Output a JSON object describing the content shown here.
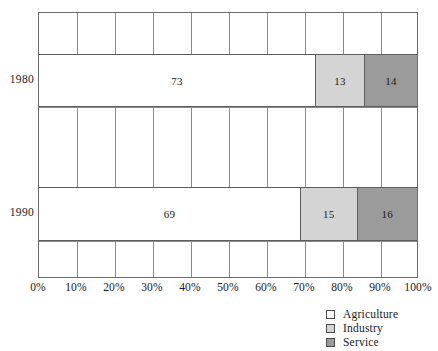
{
  "chart_data": {
    "type": "bar",
    "orientation": "horizontal",
    "stacked": true,
    "normalized_percent": true,
    "title": "",
    "xlabel": "",
    "ylabel": "",
    "xlim": [
      0,
      100
    ],
    "grid": true,
    "legend_position": "bottom-right",
    "categories": [
      "1980",
      "1990"
    ],
    "series": [
      {
        "name": "Agriculture",
        "color": "#ffffff",
        "values": [
          73,
          69
        ]
      },
      {
        "name": "Industry",
        "color": "#d4d4d4",
        "values": [
          13,
          15
        ]
      },
      {
        "name": "Service",
        "color": "#9b9b9b",
        "values": [
          14,
          16
        ]
      }
    ],
    "xticks": [
      0,
      10,
      20,
      30,
      40,
      50,
      60,
      70,
      80,
      90,
      100
    ],
    "xticklabels": [
      "0%",
      "10%",
      "20%",
      "30%",
      "40%",
      "50%",
      "60%",
      "70%",
      "80%",
      "90%",
      "100%"
    ],
    "bar_labels": {
      "1980": [
        "73",
        "13",
        "14"
      ],
      "1990": [
        "69",
        "15",
        "16"
      ]
    }
  },
  "axis": {
    "ticks": [
      {
        "label": "0%",
        "value": 0
      },
      {
        "label": "10%",
        "value": 10
      },
      {
        "label": "20%",
        "value": 20
      },
      {
        "label": "30%",
        "value": 30
      },
      {
        "label": "40%",
        "value": 40
      },
      {
        "label": "50%",
        "value": 50
      },
      {
        "label": "60%",
        "value": 60
      },
      {
        "label": "70%",
        "value": 70
      },
      {
        "label": "80%",
        "value": 80
      },
      {
        "label": "90%",
        "value": 90
      },
      {
        "label": "100%",
        "value": 100
      }
    ]
  },
  "rows": [
    {
      "category": "1980",
      "segments": [
        {
          "name": "Agriculture",
          "value": 73,
          "label": "73",
          "color": "#ffffff"
        },
        {
          "name": "Industry",
          "value": 13,
          "label": "13",
          "color": "#d4d4d4"
        },
        {
          "name": "Service",
          "value": 14,
          "label": "14",
          "color": "#9b9b9b"
        }
      ]
    },
    {
      "category": "1990",
      "segments": [
        {
          "name": "Agriculture",
          "value": 69,
          "label": "69",
          "color": "#ffffff"
        },
        {
          "name": "Industry",
          "value": 15,
          "label": "15",
          "color": "#d4d4d4"
        },
        {
          "name": "Service",
          "value": 16,
          "label": "16",
          "color": "#9b9b9b"
        }
      ]
    }
  ],
  "legend": {
    "items": [
      {
        "label": "Agriculture",
        "color": "#ffffff",
        "swatch": "agriculture"
      },
      {
        "label": "Industry",
        "color": "#d4d4d4",
        "swatch": "industry"
      },
      {
        "label": "Service",
        "color": "#9b9b9b",
        "swatch": "service"
      }
    ]
  },
  "colors": {
    "agriculture": "#ffffff",
    "industry": "#d4d4d4",
    "service": "#9b9b9b",
    "grid": "#8a8a8a",
    "frame": "#6d6d6d",
    "text": "#1a1a1a"
  }
}
